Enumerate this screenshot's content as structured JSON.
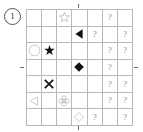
{
  "label": {
    "index": "1"
  },
  "grid": {
    "rows": 7,
    "cols": 7,
    "unknown_marker": "?",
    "colors": {
      "grid_line": "#b9b9b9",
      "filled_shape": "#111111",
      "outline_shape": "#a9a9a9",
      "question_mark": "#8d8d8d",
      "background": "#ffffff"
    },
    "cells": [
      [
        {
          "type": "empty"
        },
        {
          "type": "empty"
        },
        {
          "type": "shape",
          "shape": "star-outline"
        },
        {
          "type": "empty"
        },
        {
          "type": "empty"
        },
        {
          "type": "unknown",
          "text": "?"
        },
        {
          "type": "empty"
        }
      ],
      [
        {
          "type": "empty"
        },
        {
          "type": "empty"
        },
        {
          "type": "empty"
        },
        {
          "type": "shape",
          "shape": "triangle-left-filled"
        },
        {
          "type": "unknown",
          "text": "?"
        },
        {
          "type": "empty"
        },
        {
          "type": "unknown",
          "text": "?"
        }
      ],
      [
        {
          "type": "shape",
          "shape": "circle-outline"
        },
        {
          "type": "shape",
          "shape": "star-filled"
        },
        {
          "type": "empty"
        },
        {
          "type": "empty"
        },
        {
          "type": "empty"
        },
        {
          "type": "unknown",
          "text": "?"
        },
        {
          "type": "unknown",
          "text": "?"
        }
      ],
      [
        {
          "type": "empty"
        },
        {
          "type": "empty"
        },
        {
          "type": "empty"
        },
        {
          "type": "shape",
          "shape": "diamond-filled"
        },
        {
          "type": "empty"
        },
        {
          "type": "unknown",
          "text": "?"
        },
        {
          "type": "empty"
        }
      ],
      [
        {
          "type": "empty"
        },
        {
          "type": "shape",
          "shape": "cross-x-filled"
        },
        {
          "type": "empty"
        },
        {
          "type": "empty"
        },
        {
          "type": "empty"
        },
        {
          "type": "unknown",
          "text": "?"
        },
        {
          "type": "unknown",
          "text": "?"
        }
      ],
      [
        {
          "type": "shape",
          "shape": "triangle-left-outline"
        },
        {
          "type": "empty"
        },
        {
          "type": "shape",
          "shape": "flower-outline"
        },
        {
          "type": "empty"
        },
        {
          "type": "empty"
        },
        {
          "type": "unknown",
          "text": "?"
        },
        {
          "type": "unknown",
          "text": "?"
        }
      ],
      [
        {
          "type": "empty"
        },
        {
          "type": "empty"
        },
        {
          "type": "empty"
        },
        {
          "type": "shape",
          "shape": "diamond-outline"
        },
        {
          "type": "unknown",
          "text": "?"
        },
        {
          "type": "empty"
        },
        {
          "type": "unknown",
          "text": "?"
        }
      ]
    ],
    "extra_row": [
      {
        "type": "empty"
      },
      {
        "type": "shape",
        "shape": "shield-outline"
      },
      {
        "type": "empty"
      },
      {
        "type": "unknown",
        "text": "?"
      },
      {
        "type": "empty"
      },
      {
        "type": "empty"
      },
      {
        "type": "empty"
      }
    ]
  },
  "ticks": {
    "top": "center-tick",
    "bottom": "center-tick",
    "left": "center-tick",
    "right": "center-tick"
  }
}
